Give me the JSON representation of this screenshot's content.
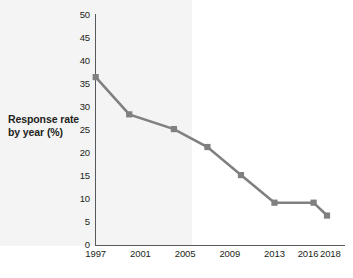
{
  "chart_data": {
    "type": "line",
    "title": "",
    "xlabel": "",
    "ylabel": "Response rate by year (%)",
    "ylim": [
      0,
      50
    ],
    "xlim": [
      1997,
      2018
    ],
    "grid": false,
    "legend": null,
    "line_color": "#808080",
    "marker": "square",
    "marker_color": "#808080",
    "shaded_region_color": "#f4f4f4",
    "axis_color": "#58595b",
    "yticks": [
      0,
      5,
      10,
      15,
      20,
      25,
      30,
      35,
      40,
      45,
      50
    ],
    "ytick_labels": [
      "0",
      "5",
      "10",
      "15",
      "20",
      "25",
      "30",
      "35",
      "40",
      "45",
      "50"
    ],
    "xticks": [
      1997,
      2001,
      2005,
      2009,
      2013,
      2016,
      2018
    ],
    "xtick_labels": [
      "1997",
      "2001",
      "2005",
      "2009",
      "2013",
      "2016",
      "2018"
    ],
    "x": [
      1997,
      2000,
      2004,
      2007,
      2010,
      2013,
      2016.5,
      2017.7
    ],
    "values": [
      36.5,
      28.4,
      25.2,
      21.3,
      15.2,
      9.2,
      9.2,
      6.4
    ],
    "series": [
      {
        "name": "Response rate by year (%)",
        "x": [
          1997,
          2000,
          2004,
          2007,
          2010,
          2013,
          2016.5,
          2017.7
        ],
        "values": [
          36.5,
          28.4,
          25.2,
          21.3,
          15.2,
          9.2,
          9.2,
          6.4
        ]
      }
    ]
  }
}
